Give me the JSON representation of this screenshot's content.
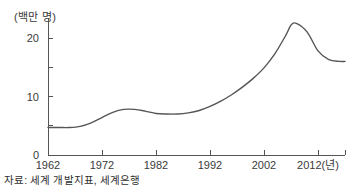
{
  "chart_data": {
    "type": "line",
    "title": "",
    "subtitle": "",
    "xlabel": "",
    "ylabel": "(백만 명)",
    "x_unit_label": "(년)",
    "xlim": [
      1962,
      2017
    ],
    "ylim": [
      0,
      24
    ],
    "grid": false,
    "legend": null,
    "line_color": "#555555",
    "axis_color": "#555555",
    "x_ticks": [
      1962,
      1972,
      1982,
      1992,
      2002,
      2012
    ],
    "x_tick_labels": [
      "1962",
      "1972",
      "1982",
      "1992",
      "2002",
      "2012(년)"
    ],
    "y_ticks": [
      0,
      5,
      10,
      15,
      20
    ],
    "y_tick_labels": [
      "0",
      "",
      "10",
      "",
      "20"
    ],
    "series": [
      {
        "name": "인구",
        "x": [
          1962,
          1964,
          1966,
          1968,
          1970,
          1972,
          1974,
          1976,
          1978,
          1980,
          1982,
          1984,
          1986,
          1988,
          1990,
          1992,
          1994,
          1996,
          1998,
          2000,
          2002,
          2004,
          2006,
          2007,
          2008,
          2010,
          2012,
          2014,
          2016,
          2017
        ],
        "values": [
          4.7,
          4.7,
          4.7,
          4.9,
          5.5,
          6.4,
          7.3,
          7.8,
          7.8,
          7.5,
          7.1,
          7.0,
          7.0,
          7.2,
          7.6,
          8.3,
          9.2,
          10.3,
          11.6,
          13.1,
          14.9,
          17.3,
          20.4,
          22.2,
          22.5,
          21.0,
          17.8,
          16.3,
          16.0,
          16.0
        ]
      }
    ]
  },
  "axes": {
    "y_axis_title": "(백만 명)"
  },
  "footer": {
    "source_note": "자료: 세계 개발지표, 세계은행"
  }
}
